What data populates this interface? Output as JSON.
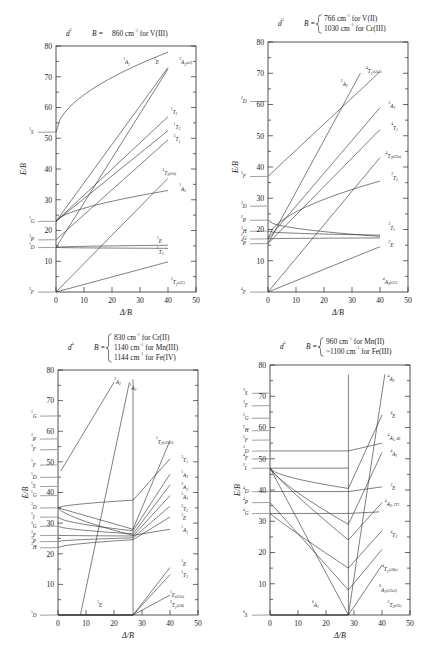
{
  "figure": {
    "kind": "tanabe-sugano-diagrams",
    "panel_count": 4,
    "axis": {
      "xlabel": "Δ/B",
      "ylabel": "E/B",
      "xticks": [
        "0",
        "10",
        "20",
        "30",
        "40",
        "50"
      ],
      "yticks": [
        "10",
        "20",
        "30",
        "40",
        "50",
        "60",
        "70",
        "80"
      ],
      "xlim": [
        0,
        50
      ],
      "ylim": [
        0,
        80
      ]
    }
  },
  "chart_data": [
    {
      "type": "line",
      "id": "d2",
      "title": "d2",
      "config_label": "d",
      "config_sup": "2",
      "B_prefix": "B = ",
      "B_lines": [
        "860 cm−1 for V(III)"
      ],
      "B_text": "B = 860 cm−1 for V(III)",
      "braced": false,
      "xlabel": "Δ/B",
      "ylabel": "E/B",
      "xlim": [
        0,
        50
      ],
      "ylim": [
        0,
        80
      ],
      "crossover": null,
      "free_ion_terms": [
        {
          "label": "1S",
          "mult": "1",
          "term": "S",
          "E": 52
        },
        {
          "label": "1G",
          "mult": "1",
          "term": "G",
          "E": 23
        },
        {
          "label": "3P",
          "mult": "3",
          "term": "P",
          "E": 17
        },
        {
          "label": "1D",
          "mult": "1",
          "term": "D",
          "E": 14.5
        },
        {
          "label": "3F",
          "mult": "3",
          "term": "F",
          "E": 0
        }
      ],
      "state_labels": [
        {
          "mult": "1",
          "term": "A",
          "sub": "1",
          "paren": "",
          "x": 24,
          "y": 74
        },
        {
          "mult": "1",
          "term": "E",
          "sub": "",
          "paren": "",
          "x": 35,
          "y": 74
        },
        {
          "mult": "3",
          "term": "A",
          "sub": "2",
          "paren": "(e2)",
          "x": 44,
          "y": 74
        },
        {
          "mult": "1",
          "term": "T",
          "sub": "1",
          "paren": "",
          "x": 41,
          "y": 58
        },
        {
          "mult": "1",
          "term": "T",
          "sub": "2",
          "paren": "",
          "x": 42,
          "y": 53
        },
        {
          "mult": "3",
          "term": "T",
          "sub": "1",
          "paren": "",
          "x": 42,
          "y": 49
        },
        {
          "mult": "3",
          "term": "T",
          "sub": "2",
          "paren": "(t2e)",
          "x": 38,
          "y": 38
        },
        {
          "mult": "1",
          "term": "A",
          "sub": "1",
          "paren": "",
          "x": 44,
          "y": 33
        },
        {
          "mult": "1",
          "term": "E",
          "sub": "",
          "paren": "",
          "x": 36,
          "y": 16
        },
        {
          "mult": "1",
          "term": "T",
          "sub": "2",
          "paren": "",
          "x": 36,
          "y": 12.5
        },
        {
          "mult": "3",
          "term": "T",
          "sub": "1",
          "paren": "(t22)",
          "x": 41,
          "y": 2.5
        }
      ]
    },
    {
      "type": "line",
      "id": "d3",
      "title": "d3",
      "config_label": "d",
      "config_sup": "3",
      "B_prefix": "B = ",
      "B_lines": [
        "766 cm−1 for V(II)",
        "1030 cm−1 for Cr(III)"
      ],
      "B_text": "B = 766 cm−1 for V(II); 1030 cm−1 for Cr(III)",
      "braced": true,
      "xlabel": "Δ/B",
      "ylabel": "E/B",
      "xlim": [
        0,
        50
      ],
      "ylim": [
        0,
        80
      ],
      "crossover": null,
      "free_ion_terms": [
        {
          "label": "2D",
          "mult": "2",
          "term": "D",
          "E": 61
        },
        {
          "label": "2F",
          "mult": "2",
          "term": "F",
          "E": 37
        },
        {
          "label": "2D",
          "mult": "2",
          "term": "D",
          "E": 27.5
        },
        {
          "label": "2P",
          "mult": "2",
          "term": "P",
          "E": 23
        },
        {
          "label": "2H",
          "mult": "2",
          "term": "H",
          "E": 19.5
        },
        {
          "label": "2G",
          "mult": "2",
          "term": "G",
          "E": 17
        },
        {
          "label": "4P",
          "mult": "4",
          "term": "P",
          "E": 15.5
        },
        {
          "label": "4F",
          "mult": "4",
          "term": "F",
          "E": 0
        }
      ],
      "state_labels": [
        {
          "mult": "4",
          "term": "T",
          "sub": "1",
          "paren": "(t2e2)",
          "x": 35,
          "y": 70
        },
        {
          "mult": "2",
          "term": "A",
          "sub": "2",
          "paren": "",
          "x": 26,
          "y": 66
        },
        {
          "mult": "2",
          "term": "A",
          "sub": "1",
          "paren": "",
          "x": 43,
          "y": 59
        },
        {
          "mult": "4",
          "term": "T",
          "sub": "1",
          "paren": "",
          "x": 44,
          "y": 52
        },
        {
          "mult": "4",
          "term": "T",
          "sub": "2",
          "paren": "(t22e)",
          "x": 42,
          "y": 43
        },
        {
          "mult": "2",
          "term": "T",
          "sub": "2",
          "paren": "",
          "x": 44,
          "y": 36
        },
        {
          "mult": "2",
          "term": "T",
          "sub": "1",
          "paren": "",
          "x": 43,
          "y": 20
        },
        {
          "mult": "2",
          "term": "E",
          "sub": "",
          "paren": "",
          "x": 43,
          "y": 14.5
        },
        {
          "mult": "4",
          "term": "A",
          "sub": "2",
          "paren": "(t23)",
          "x": 41,
          "y": 2.5
        }
      ]
    },
    {
      "type": "line",
      "id": "d4",
      "title": "d4",
      "config_label": "d",
      "config_sup": "4",
      "B_prefix": "B = ",
      "B_lines": [
        "830 cm−1 for Cr(II)",
        "1140 cm−1 for Mn(III)",
        "1144 cm−1 for Fe(IV)"
      ],
      "B_text": "B = 830 cm−1 for Cr(II); 1140 cm−1 for Mn(III); 1144 cm−1 for Fe(IV)",
      "braced": true,
      "xlabel": "Δ/B",
      "ylabel": "E/B",
      "xlim": [
        0,
        50
      ],
      "ylim": [
        0,
        80
      ],
      "crossover": 26.8,
      "free_ion_terms": [
        {
          "label": "1G",
          "mult": "1",
          "term": "G",
          "E": 65
        },
        {
          "label": "3P",
          "mult": "3",
          "term": "P",
          "E": 57.5
        },
        {
          "label": "3F",
          "mult": "3",
          "term": "F",
          "E": 54
        },
        {
          "label": "1F",
          "mult": "1",
          "term": "F",
          "E": 49
        },
        {
          "label": "1D",
          "mult": "1",
          "term": "D",
          "E": 45
        },
        {
          "label": "1S",
          "mult": "1",
          "term": "S",
          "E": 42
        },
        {
          "label": "1G",
          "mult": "1",
          "term": "G",
          "E": 39
        },
        {
          "label": "3D",
          "mult": "3",
          "term": "D",
          "E": 35
        },
        {
          "label": "1I",
          "mult": "1",
          "term": "I",
          "E": 32
        },
        {
          "label": "3G",
          "mult": "3",
          "term": "G",
          "E": 29
        },
        {
          "label": "3F",
          "mult": "3",
          "term": "F",
          "E": 26
        },
        {
          "label": "3P",
          "mult": "3",
          "term": "P",
          "E": 24
        },
        {
          "label": "3H",
          "mult": "3",
          "term": "H",
          "E": 22
        },
        {
          "label": "5D",
          "mult": "5",
          "term": "D",
          "E": 0
        }
      ],
      "state_labels": [
        {
          "mult": "3",
          "term": "A",
          "sub": "2",
          "paren": "",
          "x": 20,
          "y": 75.5
        },
        {
          "mult": "1",
          "term": "A",
          "sub": "2",
          "paren": "",
          "x": 25.5,
          "y": 73.5
        },
        {
          "mult": "5",
          "term": "T",
          "sub": "2",
          "paren": "(t23e2)",
          "x": 35,
          "y": 56
        },
        {
          "mult": "3",
          "term": "T",
          "sub": "1",
          "paren": "",
          "x": 44,
          "y": 50
        },
        {
          "mult": "1",
          "term": "A",
          "sub": "2",
          "paren": "",
          "x": 44,
          "y": 45
        },
        {
          "mult": "3",
          "term": "A",
          "sub": "2",
          "paren": "",
          "x": 44,
          "y": 41
        },
        {
          "mult": "3",
          "term": "A",
          "sub": "1",
          "paren": "",
          "x": 44,
          "y": 38
        },
        {
          "mult": "3",
          "term": "T",
          "sub": "2",
          "paren": "",
          "x": 44,
          "y": 34
        },
        {
          "mult": "3",
          "term": "E",
          "sub": "",
          "paren": "",
          "x": 44,
          "y": 31
        },
        {
          "mult": "1",
          "term": "A",
          "sub": "1",
          "paren": "",
          "x": 44,
          "y": 27
        },
        {
          "mult": "1",
          "term": "E",
          "sub": "",
          "paren": "",
          "x": 44,
          "y": 16
        },
        {
          "mult": "1",
          "term": "T",
          "sub": "2",
          "paren": "",
          "x": 44,
          "y": 12.5
        },
        {
          "mult": "5",
          "term": "E",
          "sub": "",
          "paren": "(t23e)",
          "x": 40,
          "y": 6
        },
        {
          "mult": "5",
          "term": "E",
          "sub": "",
          "paren": "",
          "x": 14,
          "y": 2.5
        },
        {
          "mult": "3",
          "term": "T",
          "sub": "1",
          "paren": "(t24)",
          "x": 40,
          "y": 2.5
        }
      ]
    },
    {
      "type": "line",
      "id": "d5",
      "title": "d5",
      "config_label": "d",
      "config_sup": "5",
      "B_prefix": "B = ",
      "B_lines": [
        "960 cm−1 for Mn(II)",
        "~1100 cm−1 for Fe(III)"
      ],
      "B_text": "B = 960 cm−1 for Mn(II); ~1100 cm−1 for Fe(III)",
      "braced": true,
      "xlabel": "Δ/B",
      "ylabel": "E/B",
      "xlim": [
        0,
        50
      ],
      "ylim": [
        0,
        80
      ],
      "crossover": 28,
      "free_ion_terms": [
        {
          "label": "2S",
          "mult": "2",
          "term": "S",
          "E": 71
        },
        {
          "label": "2F",
          "mult": "2",
          "term": "F",
          "E": 67
        },
        {
          "label": "2G",
          "mult": "2",
          "term": "G",
          "E": 63
        },
        {
          "label": "2H",
          "mult": "2",
          "term": "H",
          "E": 59
        },
        {
          "label": "2F",
          "mult": "2",
          "term": "F",
          "E": 56
        },
        {
          "label": "2D",
          "mult": "2",
          "term": "D",
          "E": 52.5
        },
        {
          "label": "4F",
          "mult": "4",
          "term": "F",
          "E": 50
        },
        {
          "label": "2I",
          "mult": "2",
          "term": "I",
          "E": 47
        },
        {
          "label": "4D",
          "mult": "4",
          "term": "D",
          "E": 39.5
        },
        {
          "label": "4P",
          "mult": "4",
          "term": "P",
          "E": 36
        },
        {
          "label": "4G",
          "mult": "4",
          "term": "G",
          "E": 32.5
        },
        {
          "label": "6S",
          "mult": "6",
          "term": "S",
          "E": 0
        }
      ],
      "state_labels": [
        {
          "mult": "4",
          "term": "A",
          "sub": "2",
          "paren": "",
          "x": 42,
          "y": 75
        },
        {
          "mult": "4",
          "term": "E",
          "sub": "",
          "paren": "",
          "x": 43,
          "y": 63
        },
        {
          "mult": "4",
          "term": "A",
          "sub": "1",
          "paren": ", 4E",
          "x": 42,
          "y": 56
        },
        {
          "mult": "4",
          "term": "A",
          "sub": "1",
          "paren": "",
          "x": 43,
          "y": 51
        },
        {
          "mult": "2",
          "term": "E",
          "sub": "",
          "paren": "",
          "x": 43,
          "y": 40
        },
        {
          "mult": "4",
          "term": "A",
          "sub": "2",
          "paren": ", 2T1",
          "x": 41,
          "y": 35
        },
        {
          "mult": "4",
          "term": "T",
          "sub": "2",
          "paren": "",
          "x": 43,
          "y": 25
        },
        {
          "mult": "4",
          "term": "T",
          "sub": "1",
          "paren": "(t24e)",
          "x": 40,
          "y": 14
        },
        {
          "mult": "6",
          "term": "A",
          "sub": "1",
          "paren": "(t23e2)",
          "x": 39,
          "y": 7.5
        },
        {
          "mult": "6",
          "term": "A",
          "sub": "1",
          "paren": "",
          "x": 15,
          "y": 2.5
        },
        {
          "mult": "2",
          "term": "T",
          "sub": "2",
          "paren": "(t25)",
          "x": 42,
          "y": 2.5
        }
      ]
    }
  ]
}
